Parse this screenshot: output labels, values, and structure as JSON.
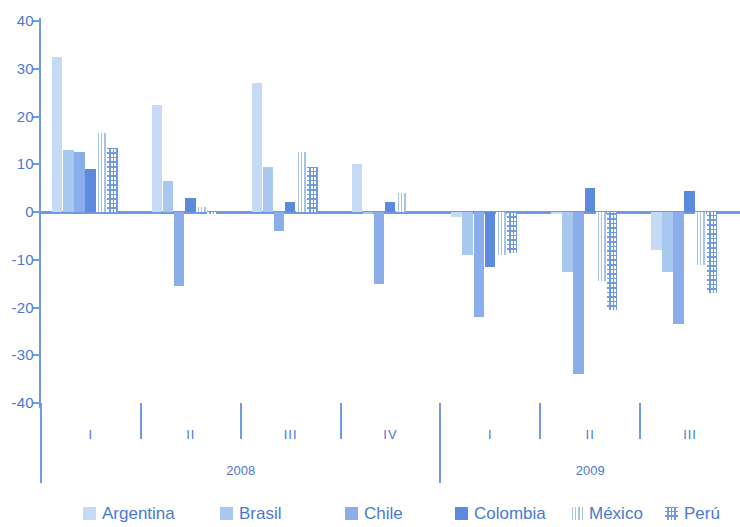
{
  "chart_data": {
    "type": "bar",
    "title": "",
    "xlabel": "",
    "ylabel": "",
    "ylim": [
      -40,
      40
    ],
    "yticks": [
      40,
      30,
      20,
      10,
      0,
      -10,
      -20,
      -30,
      -40
    ],
    "grid": false,
    "legend_position": "bottom",
    "categories": [
      "I",
      "II",
      "III",
      "IV",
      "I",
      "II",
      "III"
    ],
    "group_labels": [
      {
        "label": "2008",
        "quarters": [
          "I",
          "II",
          "III",
          "IV"
        ]
      },
      {
        "label": "2009",
        "quarters": [
          "I",
          "II",
          "III"
        ]
      }
    ],
    "series": [
      {
        "name": "Argentina",
        "color": "#c5daf4",
        "pattern": "solid",
        "values": [
          32.5,
          22.5,
          27.0,
          10.0,
          -1.0,
          -0.5,
          -8.0
        ]
      },
      {
        "name": "Brasil",
        "color": "#a9c8ef",
        "pattern": "solid",
        "values": [
          13.0,
          6.5,
          9.5,
          -0.5,
          -9.0,
          -12.5,
          -12.5
        ]
      },
      {
        "name": "Chile",
        "color": "#8badea",
        "pattern": "solid",
        "values": [
          12.5,
          -15.5,
          -4.0,
          -15.0,
          -22.0,
          -34.0,
          -23.5
        ]
      },
      {
        "name": "Colombia",
        "color": "#5b8adf",
        "pattern": "solid",
        "values": [
          9.0,
          3.0,
          2.0,
          2.0,
          -11.5,
          5.0,
          4.5
        ]
      },
      {
        "name": "México",
        "color": "#a8c3e8",
        "pattern": "vertical-lines",
        "values": [
          16.5,
          1.0,
          12.5,
          4.0,
          -9.0,
          -14.5,
          -11.0
        ]
      },
      {
        "name": "Perú",
        "color": "#6f9ae0",
        "pattern": "grid-hatch",
        "values": [
          13.5,
          -0.5,
          9.5,
          0.0,
          -8.5,
          -20.5,
          -17.0
        ]
      }
    ]
  },
  "legend": {
    "items": [
      {
        "label": "Argentina"
      },
      {
        "label": "Brasil"
      },
      {
        "label": "Chile"
      },
      {
        "label": "Colombia"
      },
      {
        "label": "México"
      },
      {
        "label": "Perú"
      }
    ]
  },
  "colors": {
    "axis": "#6f9ae0",
    "text": "#4a79cf",
    "background": "#ffffff"
  }
}
